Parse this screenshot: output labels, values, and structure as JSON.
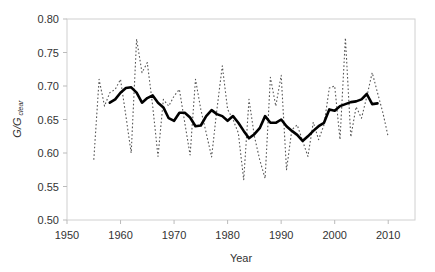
{
  "chart_data": {
    "type": "line",
    "title": "",
    "xlabel": "Year",
    "ylabel": "G/G",
    "ylabel_subscript": "clear",
    "xlim": [
      1950,
      2015
    ],
    "ylim": [
      0.5,
      0.8
    ],
    "x_ticks": [
      1950,
      1960,
      1970,
      1980,
      1990,
      2000,
      2010
    ],
    "x_tick_labels": [
      "1950",
      "1960",
      "1970",
      "1980",
      "1990",
      "2000",
      "2010"
    ],
    "y_ticks": [
      0.5,
      0.55,
      0.6,
      0.65,
      0.7,
      0.75,
      0.8
    ],
    "y_tick_labels": [
      "0.50",
      "0.55",
      "0.60",
      "0.65",
      "0.70",
      "0.75",
      "0.80"
    ],
    "grid": false,
    "legend": "none",
    "series": [
      {
        "name": "annual",
        "style": "dotted",
        "color": "#555555",
        "x": [
          1955,
          1956,
          1957,
          1958,
          1959,
          1960,
          1961,
          1962,
          1963,
          1964,
          1965,
          1966,
          1967,
          1968,
          1969,
          1970,
          1971,
          1972,
          1973,
          1974,
          1975,
          1976,
          1977,
          1978,
          1979,
          1980,
          1981,
          1982,
          1983,
          1984,
          1985,
          1986,
          1987,
          1988,
          1989,
          1990,
          1991,
          1992,
          1993,
          1994,
          1995,
          1996,
          1997,
          1998,
          1999,
          2000,
          2001,
          2002,
          2003,
          2004,
          2005,
          2006,
          2007,
          2008,
          2009,
          2010
        ],
        "values": [
          0.59,
          0.71,
          0.67,
          0.69,
          0.695,
          0.71,
          0.655,
          0.6,
          0.77,
          0.72,
          0.735,
          0.67,
          0.595,
          0.68,
          0.67,
          0.685,
          0.695,
          0.645,
          0.597,
          0.71,
          0.665,
          0.63,
          0.594,
          0.665,
          0.73,
          0.665,
          0.65,
          0.63,
          0.56,
          0.68,
          0.625,
          0.59,
          0.562,
          0.713,
          0.67,
          0.716,
          0.575,
          0.635,
          0.642,
          0.618,
          0.595,
          0.646,
          0.62,
          0.642,
          0.697,
          0.7,
          0.62,
          0.772,
          0.624,
          0.669,
          0.652,
          0.684,
          0.72,
          0.69,
          0.66,
          0.624
        ]
      },
      {
        "name": "smoothed",
        "style": "solid",
        "color": "#000000",
        "x": [
          1958,
          1959,
          1960,
          1961,
          1962,
          1963,
          1964,
          1965,
          1966,
          1967,
          1968,
          1969,
          1970,
          1971,
          1972,
          1973,
          1974,
          1975,
          1976,
          1977,
          1978,
          1979,
          1980,
          1981,
          1982,
          1983,
          1984,
          1985,
          1986,
          1987,
          1988,
          1989,
          1990,
          1991,
          1992,
          1993,
          1994,
          1995,
          1996,
          1997,
          1998,
          1999,
          2000,
          2001,
          2002,
          2003,
          2004,
          2005,
          2006,
          2007,
          2008
        ],
        "values": [
          0.675,
          0.68,
          0.69,
          0.697,
          0.698,
          0.69,
          0.675,
          0.682,
          0.686,
          0.675,
          0.668,
          0.652,
          0.648,
          0.66,
          0.66,
          0.653,
          0.64,
          0.641,
          0.655,
          0.664,
          0.658,
          0.655,
          0.648,
          0.655,
          0.645,
          0.633,
          0.622,
          0.628,
          0.637,
          0.655,
          0.645,
          0.645,
          0.65,
          0.64,
          0.633,
          0.627,
          0.618,
          0.625,
          0.633,
          0.64,
          0.645,
          0.665,
          0.663,
          0.67,
          0.673,
          0.676,
          0.677,
          0.68,
          0.688,
          0.673,
          0.674
        ]
      }
    ]
  }
}
